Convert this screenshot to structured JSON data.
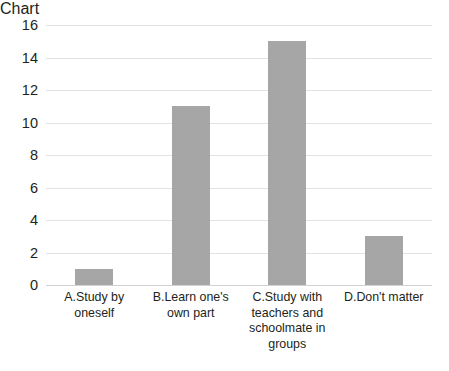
{
  "chart_data": {
    "type": "bar",
    "title": "",
    "xlabel": "",
    "ylabel": "",
    "categories": [
      "A.Study by oneself",
      "B.Learn one's\nown part",
      "C.Study with\nteachers and\nschoolmate in\ngroups",
      "D.Don't matter"
    ],
    "values": [
      1,
      11,
      15,
      3
    ],
    "ylim": [
      0,
      16
    ],
    "yticks": [
      0,
      2,
      4,
      6,
      8,
      10,
      12,
      14,
      16
    ],
    "ytick_labels": [
      "0",
      "2",
      "4",
      "6",
      "8",
      "10",
      "12",
      "14",
      "16"
    ],
    "grid": true,
    "grid_axis": "y",
    "legend": false,
    "legend_position": "none",
    "bar_color": "#a6a6a6",
    "grid_color": "#e2e2e4",
    "background_color": "#ffffff",
    "text_color": "#231f20"
  },
  "artifacts": {
    "bleed_marks": [
      "·",
      "·",
      "·",
      "·",
      "·",
      "·"
    ]
  }
}
